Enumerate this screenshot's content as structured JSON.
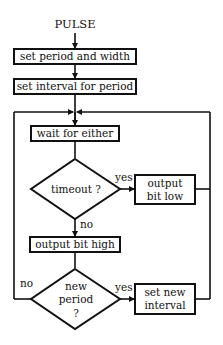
{
  "title": "PULSE",
  "nodes": {
    "set_period": "set period and width",
    "set_interval": "set interval for period",
    "wait": "wait for either",
    "timeout": "timeout ?",
    "output_low_1": "output",
    "output_low_2": "bit low",
    "output_high": "output bit high",
    "new_period_1": "new",
    "new_period_2": "period",
    "new_period_3": "?",
    "set_new_interval_1": "set new",
    "set_new_interval_2": "interval"
  },
  "labels": {
    "yes1": "yes",
    "no1": "no",
    "yes2": "yes",
    "no2": "no"
  },
  "colors": {
    "ink": "#111111",
    "background": "#ffffff"
  }
}
